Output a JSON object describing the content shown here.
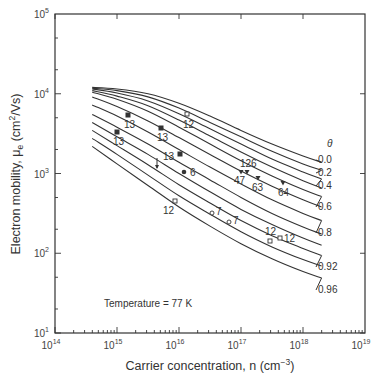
{
  "chart_data": {
    "type": "line",
    "title": "",
    "xlabel": "Carrier concentration, n (cm−3)",
    "ylabel": "Electron mobility, μe (cm2/Vs)",
    "xscale": "log",
    "yscale": "log",
    "xlim": [
      100000000000000.0,
      1e+19
    ],
    "ylim": [
      10.0,
      100000.0
    ],
    "x_ticks": [
      "10^14",
      "10^15",
      "10^16",
      "10^17",
      "10^18",
      "10^19"
    ],
    "y_ticks": [
      "10^1",
      "10^2",
      "10^3",
      "10^4",
      "10^5"
    ],
    "legend_title": "θ",
    "annotation": "Temperature = 77 K",
    "series": [
      {
        "name": "0.0",
        "points": [
          [
            14.6,
            4.08
          ],
          [
            15.0,
            4.06
          ],
          [
            15.5,
            4.0
          ],
          [
            16.0,
            3.88
          ],
          [
            16.5,
            3.72
          ],
          [
            17.0,
            3.54
          ],
          [
            17.5,
            3.37
          ],
          [
            18.0,
            3.22
          ],
          [
            18.3,
            3.14
          ]
        ]
      },
      {
        "name": "0.2",
        "points": [
          [
            14.6,
            4.07
          ],
          [
            15.0,
            4.04
          ],
          [
            15.5,
            3.96
          ],
          [
            16.0,
            3.82
          ],
          [
            16.5,
            3.64
          ],
          [
            17.0,
            3.46
          ],
          [
            17.5,
            3.28
          ],
          [
            18.0,
            3.12
          ],
          [
            18.3,
            3.04
          ]
        ]
      },
      {
        "name": "0.4",
        "points": [
          [
            14.6,
            4.06
          ],
          [
            15.0,
            4.01
          ],
          [
            15.5,
            3.91
          ],
          [
            16.0,
            3.75
          ],
          [
            16.5,
            3.56
          ],
          [
            17.0,
            3.37
          ],
          [
            17.5,
            3.18
          ],
          [
            18.0,
            3.02
          ],
          [
            18.3,
            2.93
          ]
        ]
      },
      {
        "name": "0.5",
        "points": [
          [
            14.6,
            4.04
          ],
          [
            15.0,
            3.97
          ],
          [
            15.5,
            3.85
          ],
          [
            16.0,
            3.67
          ],
          [
            16.5,
            3.47
          ],
          [
            17.0,
            3.27
          ],
          [
            17.5,
            3.08
          ],
          [
            18.0,
            2.91
          ],
          [
            18.3,
            2.82
          ]
        ]
      },
      {
        "name": "0.6",
        "points": [
          [
            14.6,
            4.02
          ],
          [
            15.0,
            3.93
          ],
          [
            15.5,
            3.78
          ],
          [
            16.0,
            3.58
          ],
          [
            16.5,
            3.37
          ],
          [
            17.0,
            3.16
          ],
          [
            17.5,
            2.97
          ],
          [
            18.0,
            2.8
          ],
          [
            18.3,
            2.71
          ]
        ]
      },
      {
        "name": "0.7",
        "points": [
          [
            14.6,
            3.96
          ],
          [
            15.0,
            3.84
          ],
          [
            15.5,
            3.66
          ],
          [
            16.0,
            3.45
          ],
          [
            16.5,
            3.24
          ],
          [
            17.0,
            3.03
          ],
          [
            17.5,
            2.84
          ],
          [
            18.0,
            2.67
          ],
          [
            18.3,
            2.58
          ]
        ]
      },
      {
        "name": "0.8",
        "points": [
          [
            14.6,
            3.86
          ],
          [
            15.0,
            3.72
          ],
          [
            15.5,
            3.52
          ],
          [
            16.0,
            3.3
          ],
          [
            16.5,
            3.08
          ],
          [
            17.0,
            2.87
          ],
          [
            17.5,
            2.67
          ],
          [
            18.0,
            2.5
          ],
          [
            18.3,
            2.41
          ]
        ]
      },
      {
        "name": "0.85",
        "points": [
          [
            14.6,
            3.74
          ],
          [
            15.0,
            3.58
          ],
          [
            15.5,
            3.37
          ],
          [
            16.0,
            3.14
          ],
          [
            16.5,
            2.92
          ],
          [
            17.0,
            2.7
          ],
          [
            17.5,
            2.5
          ],
          [
            18.0,
            2.33
          ],
          [
            18.3,
            2.24
          ]
        ]
      },
      {
        "name": "0.88",
        "points": [
          [
            14.6,
            3.64
          ],
          [
            15.0,
            3.46
          ],
          [
            15.5,
            3.24
          ],
          [
            16.0,
            3.0
          ],
          [
            16.5,
            2.77
          ],
          [
            17.0,
            2.55
          ],
          [
            17.5,
            2.36
          ],
          [
            18.0,
            2.19
          ],
          [
            18.3,
            2.1
          ]
        ]
      },
      {
        "name": "0.92",
        "points": [
          [
            14.6,
            3.54
          ],
          [
            15.0,
            3.35
          ],
          [
            15.5,
            3.11
          ],
          [
            16.0,
            2.86
          ],
          [
            16.5,
            2.63
          ],
          [
            17.0,
            2.41
          ],
          [
            17.5,
            2.22
          ],
          [
            18.0,
            2.06
          ],
          [
            18.3,
            1.97
          ]
        ]
      },
      {
        "name": "0.94",
        "points": [
          [
            14.6,
            3.44
          ],
          [
            15.0,
            3.24
          ],
          [
            15.5,
            2.98
          ],
          [
            16.0,
            2.72
          ],
          [
            16.5,
            2.49
          ],
          [
            17.0,
            2.27
          ],
          [
            17.5,
            2.08
          ],
          [
            18.0,
            1.92
          ],
          [
            18.3,
            1.84
          ]
        ]
      },
      {
        "name": "0.96",
        "points": [
          [
            14.6,
            3.34
          ],
          [
            15.0,
            3.12
          ],
          [
            15.5,
            2.85
          ],
          [
            16.0,
            2.58
          ],
          [
            16.5,
            2.34
          ],
          [
            17.0,
            2.12
          ],
          [
            17.5,
            1.93
          ],
          [
            18.0,
            1.77
          ],
          [
            18.3,
            1.69
          ]
        ]
      }
    ],
    "theta_labels": [
      {
        "text": "0.0",
        "y_px": 163
      },
      {
        "text": "0.2",
        "y_px": 176
      },
      {
        "text": "0.4",
        "y_px": 189
      },
      {
        "text": "0.6",
        "y_px": 210
      },
      {
        "text": "0.8",
        "y_px": 236
      },
      {
        "text": "0.92",
        "y_px": 270
      },
      {
        "text": "0.96",
        "y_px": 293
      }
    ],
    "data_points": [
      {
        "marker": "filled-square",
        "x_px": 128,
        "y_px": 115,
        "label": "13",
        "lx": 124,
        "ly": 128
      },
      {
        "marker": "filled-square",
        "x_px": 117,
        "y_px": 132,
        "label": "13",
        "lx": 113,
        "ly": 145
      },
      {
        "marker": "filled-square",
        "x_px": 161,
        "y_px": 128,
        "label": "13",
        "lx": 157,
        "ly": 141
      },
      {
        "marker": "filled-square",
        "x_px": 180,
        "y_px": 154,
        "label": "13",
        "lx": 163,
        "ly": 160
      },
      {
        "marker": "open-square",
        "x_px": 187,
        "y_px": 114,
        "label": "12",
        "lx": 183,
        "ly": 128
      },
      {
        "marker": "filled-circle",
        "x_px": 184,
        "y_px": 172,
        "label": "6",
        "lx": 190,
        "ly": 176
      },
      {
        "marker": "arrow-down",
        "x_px": 157,
        "y_px": 165,
        "label": "",
        "lx": 0,
        "ly": 0
      },
      {
        "marker": "open-square",
        "x_px": 175,
        "y_px": 201,
        "label": "12",
        "lx": 163,
        "ly": 214
      },
      {
        "marker": "open-circle",
        "x_px": 212,
        "y_px": 213,
        "label": "7",
        "lx": 216,
        "ly": 215
      },
      {
        "marker": "open-circle",
        "x_px": 229,
        "y_px": 222,
        "label": "7",
        "lx": 233,
        "ly": 224
      },
      {
        "marker": "triangle-down",
        "x_px": 241,
        "y_px": 172,
        "label": "47",
        "lx": 234,
        "ly": 184
      },
      {
        "marker": "triangle-down",
        "x_px": 247,
        "y_px": 172,
        "label": "126",
        "lx": 240,
        "ly": 167
      },
      {
        "marker": "triangle-down",
        "x_px": 258,
        "y_px": 178,
        "label": "63",
        "lx": 252,
        "ly": 191
      },
      {
        "marker": "triangle-down",
        "x_px": 283,
        "y_px": 183,
        "label": "64",
        "lx": 278,
        "ly": 196
      },
      {
        "marker": "open-square",
        "x_px": 270,
        "y_px": 241,
        "label": "12",
        "lx": 265,
        "ly": 235
      },
      {
        "marker": "open-square",
        "x_px": 280,
        "y_px": 238,
        "label": "12",
        "lx": 284,
        "ly": 242
      }
    ]
  },
  "axes": {
    "x_tick_labels": [
      {
        "base": "10",
        "exp": "14"
      },
      {
        "base": "10",
        "exp": "15"
      },
      {
        "base": "10",
        "exp": "16"
      },
      {
        "base": "10",
        "exp": "17"
      },
      {
        "base": "10",
        "exp": "18"
      },
      {
        "base": "10",
        "exp": "19"
      }
    ],
    "y_tick_labels": [
      {
        "base": "10",
        "exp": "5"
      },
      {
        "base": "10",
        "exp": "4"
      },
      {
        "base": "10",
        "exp": "3"
      },
      {
        "base": "10",
        "exp": "2"
      },
      {
        "base": "10",
        "exp": "1"
      }
    ],
    "xlabel_main": "Carrier concentration,  n (cm",
    "xlabel_exp": "−3",
    "xlabel_end": ")",
    "ylabel_main": "Electron mobility, μ",
    "ylabel_sub": "e",
    "ylabel_units": " (cm",
    "ylabel_exp": "2",
    "ylabel_end": "/Vs)"
  },
  "legend": {
    "title": "θ"
  },
  "annotation": {
    "text": "Temperature = 77 K"
  },
  "colors": {
    "ink": "#333333",
    "background": "#ffffff"
  }
}
